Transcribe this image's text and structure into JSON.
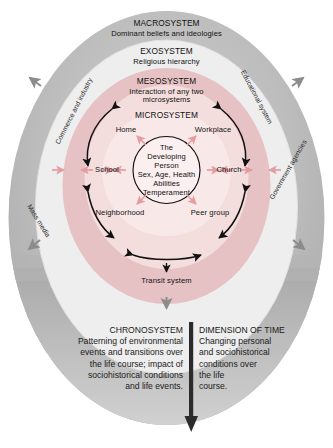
{
  "figure": {
    "kind": "bronfenbrenner-ecological-systems-diagram",
    "background_color": "#ffffff"
  },
  "rings": [
    {
      "key": "macro",
      "title": "MACROSYSTEM",
      "subtitle": "Dominant beliefs and ideologies",
      "color": "#b6b6b6"
    },
    {
      "key": "exo",
      "title": "EXOSYSTEM",
      "subtitle": "Religious hierarchy",
      "color": "#efefef"
    },
    {
      "key": "meso",
      "title": "MESOSYSTEM",
      "subtitle": "Interaction of any two\nmicrosystems",
      "subtitle_line1": "Interaction of any two",
      "subtitle_line2": "microsystems",
      "color": "#e9c3c4"
    },
    {
      "key": "micro",
      "title": "MICROSYSTEM",
      "subtitle": "",
      "color": "#f3dcdc"
    }
  ],
  "center": {
    "lines": [
      "The",
      "Developing",
      "Person",
      "Sex, Age, Health",
      "Abilities",
      "Temperament"
    ],
    "fill": "#fbeff0",
    "stroke": "#111111"
  },
  "microsystem_nodes": [
    {
      "label": "Home",
      "position": "top-left"
    },
    {
      "label": "Workplace",
      "position": "top-right"
    },
    {
      "label": "School",
      "position": "left"
    },
    {
      "label": "Church",
      "position": "right"
    },
    {
      "label": "Neighborhood",
      "position": "bottom-left"
    },
    {
      "label": "Peer group",
      "position": "bottom-right"
    }
  ],
  "exosystem_labels": [
    {
      "label": "Commerce and industry",
      "position": "upper-left"
    },
    {
      "label": "Educational system",
      "position": "upper-right"
    },
    {
      "label": "Mass media",
      "position": "lower-left"
    },
    {
      "label": "Government agencies",
      "position": "lower-right"
    },
    {
      "label": "Transit system",
      "position": "bottom"
    }
  ],
  "bottom": {
    "left": {
      "heading": "CHRONOSYSTEM",
      "body": "Patterning of environmental events and transitions over the life course; impact of sociohistorical conditions and life events.",
      "lines": [
        "Patterning of environmental",
        "events and transitions over",
        "the life course; impact of",
        "sociohistorical conditions",
        "and life events."
      ]
    },
    "right": {
      "heading": "DIMENSION OF TIME",
      "body": "Changing personal and sociohistorical conditions over the life course.",
      "lines": [
        "Changing personal",
        "and sociohistorical",
        "conditions over",
        "the life",
        "course."
      ]
    },
    "arrow": {
      "name": "time-arrow",
      "direction": "down"
    }
  },
  "colors": {
    "macro": "#b6b6b6",
    "exo": "#efefef",
    "meso": "#e9c3c4",
    "micro": "#f3dcdc",
    "center": "#fbeff0",
    "arrow_pink": "#e39ca0",
    "arrow_dark": "#111111",
    "arrow_gray": "#8c8c8c",
    "text": "#111111"
  }
}
